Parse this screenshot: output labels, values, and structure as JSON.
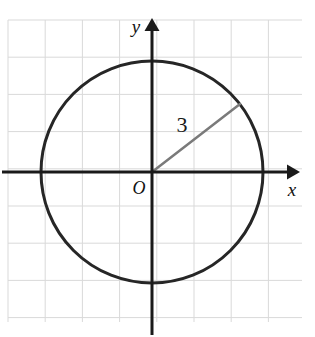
{
  "figure": {
    "background_color": "#ffffff",
    "width": 315,
    "height": 337
  },
  "grid": {
    "color": "#d9d9d9",
    "cell_size": 37.2,
    "left": 8,
    "top": 20,
    "right": 302,
    "bottom": 322,
    "columns": 8,
    "rows": 8,
    "visible": true
  },
  "axes": {
    "color": "#1a1a1a",
    "x_axis": {
      "label": "x",
      "y_pixel": 172,
      "start_x": 2,
      "end_x": 300,
      "arrow": "right"
    },
    "y_axis": {
      "label": "y",
      "x_pixel": 152,
      "start_y": 335,
      "end_y": 18,
      "arrow": "up"
    },
    "origin": {
      "label": "O",
      "x_pixel": 152,
      "y_pixel": 172
    }
  },
  "chart_data": {
    "type": "scatter",
    "title": "",
    "xlabel": "x",
    "ylabel": "y",
    "annotations": [
      {
        "name": "radius-label",
        "text": "3",
        "x_pixel": 182,
        "y_pixel": 132
      },
      {
        "name": "origin-label",
        "text": "O",
        "x_pixel": 133,
        "y_pixel": 194
      }
    ],
    "shapes": [
      {
        "name": "circle",
        "type": "circle",
        "center_x_pixel": 152,
        "center_y_pixel": 172,
        "radius_pixel": 111,
        "radius_units": 3,
        "stroke": "#262626",
        "stroke_width": 3,
        "fill": "none"
      },
      {
        "name": "radius-segment",
        "type": "line",
        "x1_pixel": 152,
        "y1_pixel": 172,
        "x2_pixel": 240,
        "y2_pixel": 104,
        "stroke": "#7a7a7a",
        "stroke_width": 2.5,
        "length_units": 3
      }
    ],
    "grid": true,
    "legend": "none"
  }
}
